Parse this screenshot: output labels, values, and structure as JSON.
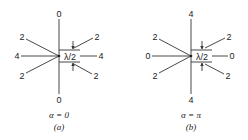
{
  "figure": {
    "panels": [
      {
        "id": "a",
        "caption": "(a)",
        "condition": "α = 0",
        "top_label": "0",
        "bottom_label": "0",
        "left_label": "4",
        "right_label": "4",
        "upper_left_label": "2",
        "lower_left_label": "2",
        "upper_right_label": "2",
        "lower_right_label": "2",
        "spacing_label": "λ/2"
      },
      {
        "id": "b",
        "caption": "(b)",
        "condition": "α = π",
        "top_label": "4",
        "bottom_label": "4",
        "left_label": "0",
        "right_label": "0",
        "upper_left_label": "2",
        "lower_left_label": "2",
        "upper_right_label": "2",
        "lower_right_label": "2",
        "spacing_label": "λ/2"
      }
    ]
  }
}
